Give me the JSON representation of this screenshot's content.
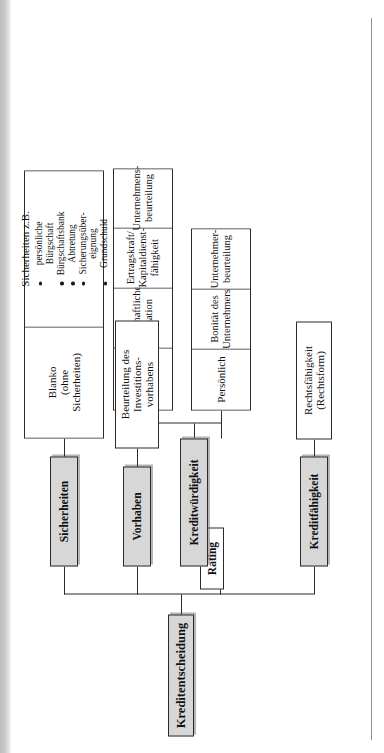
{
  "diagram": {
    "title": "Kreditentscheidung",
    "orientation": "rotated-90-ccw",
    "root": {
      "label": "Kreditentscheidung"
    },
    "overlay": {
      "label": "Rating"
    },
    "branches": [
      {
        "key": "kreditfaehigkeit",
        "label": "Kreditfähigkeit",
        "fill": "#d7d7d7",
        "children": [
          {
            "label": "Rechtsfähigkeit\n(Rechtsform)"
          }
        ]
      },
      {
        "key": "kreditwuerdigkeit",
        "label": "Kreditwürdigkeit",
        "fill": "#d7d7d7",
        "subgroups": [
          {
            "key": "persoenlich",
            "label": "Persönlich",
            "fill": "#b9b9b9",
            "children": [
              {
                "label": "Bonität des\nUnternehmers"
              },
              {
                "label": "Unternehmer-\nbeurteilung"
              }
            ]
          },
          {
            "key": "wirtschaftlich",
            "label": "Wirtschaftlich",
            "fill": "#b9b9b9",
            "children": [
              {
                "label": "Wirtschaftliche\nSituation"
              },
              {
                "label": "Ertragskraft/\nKapitaldienst-\nfähigkeit"
              },
              {
                "label": "Unternehmens-\nbeurteilung"
              }
            ]
          }
        ]
      },
      {
        "key": "vorhaben",
        "label": "Vorhaben",
        "fill": "#d7d7d7",
        "children": [
          {
            "label": "Beurteilung des\nInvestitions-\nvorhabens"
          }
        ]
      },
      {
        "key": "sicherheiten",
        "label": "Sicherheiten",
        "fill": "#d7d7d7",
        "children": [
          {
            "label": "Blanko\n(ohne\nSicherheiten)"
          }
        ],
        "list": {
          "heading": "Sicherheiten z.B.",
          "items": [
            "persönliche",
            "Bürgschaft",
            "Bürgschaftsbank",
            "Abtretung",
            "Sicherungsüber-",
            "eignung",
            "Grundschuld"
          ],
          "bulleted": [
            true,
            false,
            true,
            true,
            true,
            false,
            true
          ]
        }
      }
    ],
    "colors": {
      "line": "#2b2b2b",
      "level1_fill": "#d7d7d7",
      "level2_fill": "#b9b9b9",
      "leaf_fill": "#ffffff",
      "page_background": "#ffffff"
    }
  }
}
